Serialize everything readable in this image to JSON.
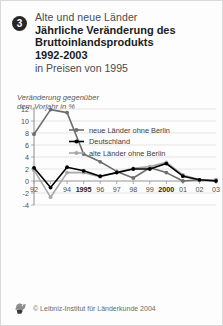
{
  "header": {
    "badge_number": "3",
    "subtitle_top": "Alte und neue Länder",
    "title_line1": "Jährliche Veränderung des",
    "title_line2": "Bruttoinlandsprodukts",
    "title_years": "1992-2003",
    "subtitle_bottom": "in Preisen von 1995"
  },
  "axis_caption": {
    "line1": "Veränderung gegenüber",
    "line2": "dem Vorjahr in %"
  },
  "footer": {
    "copyright": "© Leibniz-Institut für Länderkunde 2004",
    "logo_name": "leibniz-institut-logo"
  },
  "colors": {
    "series_neue": "#6e6e6e",
    "series_deutschland": "#000000",
    "series_alte": "#a8a8a8",
    "grid": "#d8d8d8",
    "axis": "#9a9a9a",
    "text": "#4f4f4f"
  },
  "chart_data": {
    "type": "line",
    "title": "Jährliche Veränderung des Bruttoinlandsprodukts 1992-2003",
    "subtitle": "in Preisen von 1995",
    "xlabel": "",
    "ylabel": "Veränderung gegenüber dem Vorjahr in %",
    "ylim": [
      -4,
      12
    ],
    "yticks": [
      -4,
      -2,
      0,
      2,
      4,
      6,
      8,
      10,
      12
    ],
    "ytick_labels": [
      "-4",
      "-2",
      "0",
      "2",
      "4",
      "6",
      "8",
      "10",
      "12"
    ],
    "categories": [
      1992,
      1993,
      1994,
      1995,
      1996,
      1997,
      1998,
      1999,
      2000,
      2001,
      2002,
      2003
    ],
    "xtick_labels": [
      "92",
      "93",
      "94",
      "1995",
      "96",
      "97",
      "98",
      "99",
      "2000",
      "01",
      "02",
      "03"
    ],
    "xtick_bold": [
      false,
      false,
      false,
      true,
      false,
      false,
      false,
      false,
      true,
      false,
      false,
      false
    ],
    "xtick_hidden": [
      false,
      true,
      false,
      false,
      false,
      false,
      false,
      false,
      false,
      false,
      false,
      false
    ],
    "grid": true,
    "legend_position": "upper-right-inside",
    "series": [
      {
        "name": "neue Länder ohne Berlin",
        "color": "#6e6e6e",
        "values": [
          7.8,
          11.9,
          11.4,
          4.5,
          3.2,
          1.6,
          0.5,
          2.2,
          1.4,
          0.0,
          0.2,
          0.2
        ]
      },
      {
        "name": "Deutschland",
        "color": "#000000",
        "values": [
          2.2,
          -1.1,
          2.3,
          1.7,
          0.8,
          1.4,
          2.0,
          2.0,
          2.9,
          0.8,
          0.2,
          0.0
        ]
      },
      {
        "name": "alte Länder ohne Berlin",
        "color": "#a8a8a8",
        "values": [
          1.8,
          -2.7,
          1.4,
          1.4,
          0.7,
          1.4,
          2.1,
          2.4,
          3.1,
          1.0,
          0.2,
          0.2
        ]
      }
    ]
  }
}
